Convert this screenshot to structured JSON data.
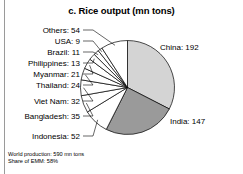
{
  "chart_data": {
    "type": "pie",
    "title": "c. Rice output (mn tons)",
    "unit": "mn tons",
    "categories": [
      "China",
      "India",
      "Indonesia",
      "Bangladesh",
      "Viet Nam",
      "Thailand",
      "Myanmar",
      "Philippines",
      "Brazil",
      "USA",
      "Others"
    ],
    "values": [
      192,
      147,
      52,
      35,
      32,
      24,
      21,
      13,
      11,
      9,
      54
    ],
    "labels": [
      {
        "name": "China",
        "value": 192,
        "text": "China: 192",
        "fill": "#d4d4d4",
        "side": "right"
      },
      {
        "name": "India",
        "value": 147,
        "text": "India: 147",
        "fill": "#9a9a9a",
        "side": "right"
      },
      {
        "name": "Indonesia",
        "value": 52,
        "text": "Indonesia: 52",
        "fill": "#ffffff",
        "side": "left"
      },
      {
        "name": "Bangladesh",
        "value": 35,
        "text": "Bangladesh: 35",
        "fill": "#ffffff",
        "side": "left"
      },
      {
        "name": "Viet Nam",
        "value": 32,
        "text": "Viet Nam: 32",
        "fill": "#ffffff",
        "side": "left"
      },
      {
        "name": "Thailand",
        "value": 24,
        "text": "Thailand: 24",
        "fill": "#ffffff",
        "side": "left"
      },
      {
        "name": "Myanmar",
        "value": 21,
        "text": "Myanmar: 21",
        "fill": "#ffffff",
        "side": "left"
      },
      {
        "name": "Philippines",
        "value": 13,
        "text": "Philippines: 13",
        "fill": "#ffffff",
        "side": "left"
      },
      {
        "name": "Brazil",
        "value": 11,
        "text": "Brazil: 11",
        "fill": "#ffffff",
        "side": "left"
      },
      {
        "name": "USA",
        "value": 9,
        "text": "USA: 9",
        "fill": "#ffffff",
        "side": "left"
      },
      {
        "name": "Others",
        "value": 54,
        "text": "Others: 54",
        "fill": "#ffffff",
        "side": "left"
      }
    ],
    "total": 590,
    "legend": "none",
    "grid": false
  },
  "footer": {
    "line1": "World production: 590 mn tons",
    "line2": "Share of EMM: 58%"
  }
}
